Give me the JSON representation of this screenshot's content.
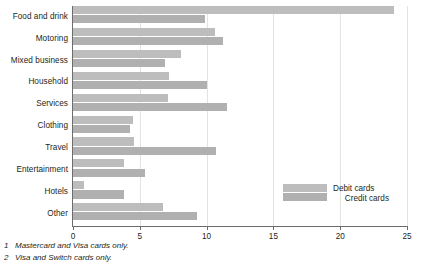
{
  "chart_data": {
    "type": "bar",
    "orientation": "horizontal",
    "title": "",
    "xlabel": "",
    "ylabel": "",
    "xlim": [
      0,
      25
    ],
    "grid": true,
    "grid_axis": "x",
    "legend_position": "inside-right",
    "categories": [
      "Food and drink",
      "Motoring",
      "Mixed business",
      "Household",
      "Services",
      "Clothing",
      "Travel",
      "Entertainment",
      "Hotels",
      "Other"
    ],
    "series": [
      {
        "name": "Debit cards",
        "color": "#bdbdbd",
        "values": [
          24.0,
          10.6,
          8.1,
          7.2,
          7.1,
          4.5,
          4.6,
          3.8,
          0.8,
          6.7
        ]
      },
      {
        "name": "Credit cards",
        "color": "#b0b0b0",
        "values": [
          9.9,
          11.2,
          6.9,
          10.0,
          11.5,
          4.3,
          10.7,
          5.4,
          3.8,
          9.3
        ]
      }
    ],
    "ticks": [
      {
        "value": 0,
        "label": "0"
      },
      {
        "value": 5,
        "label": "5"
      },
      {
        "value": 10,
        "label": "10"
      },
      {
        "value": 15,
        "label": "15"
      },
      {
        "value": 20,
        "label": "20"
      },
      {
        "value": 25,
        "label": "25"
      }
    ]
  },
  "legend": {
    "items": [
      {
        "label": "Debit cards",
        "color": "#bdbdbd"
      },
      {
        "label": "Credit cards",
        "color": "#b0b0b0"
      }
    ]
  },
  "footnotes": [
    {
      "num": "1",
      "text": "Mastercard and Visa cards only."
    },
    {
      "num": "2",
      "text": "Visa and Switch cards only."
    }
  ]
}
